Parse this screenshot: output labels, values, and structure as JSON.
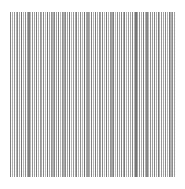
{
  "figure": {
    "background_color": "#ffffff",
    "width": 185,
    "height": 189
  },
  "plot": {
    "background_color": "#ffffff",
    "left": 10,
    "top": 12,
    "width": 166,
    "height": 165,
    "grid": false,
    "spines_visible": false,
    "axis_labels_visible": false,
    "tick_labels_visible": false,
    "title_visible": false,
    "legend_visible": false
  },
  "chart_data": {
    "type": "bar",
    "title": "",
    "subtitle": "",
    "xlabel": "",
    "ylabel": "",
    "grid": false,
    "legend": null,
    "legend_position": "none",
    "xlim": [
      0,
      90
    ],
    "ylim": [
      0,
      1
    ],
    "orientation": "vertical",
    "bar_width_px": 1.1,
    "categories": [
      "0",
      "1",
      "2",
      "3",
      "4",
      "5",
      "6",
      "7",
      "8",
      "9",
      "10",
      "11",
      "12",
      "13",
      "14",
      "15",
      "16",
      "17",
      "18",
      "19",
      "20",
      "21",
      "22",
      "23",
      "24",
      "25",
      "26",
      "27",
      "28",
      "29",
      "30",
      "31",
      "32",
      "33",
      "34",
      "35",
      "36",
      "37",
      "38",
      "39",
      "40",
      "41",
      "42",
      "43",
      "44",
      "45",
      "46",
      "47",
      "48",
      "49",
      "50",
      "51",
      "52",
      "53",
      "54",
      "55",
      "56",
      "57",
      "58",
      "59",
      "60",
      "61",
      "62",
      "63",
      "64",
      "65",
      "66",
      "67",
      "68",
      "69",
      "70",
      "71",
      "72",
      "73",
      "74",
      "75",
      "76",
      "77",
      "78",
      "79",
      "80",
      "81",
      "82",
      "83",
      "84",
      "85",
      "86",
      "87",
      "88",
      "89"
    ],
    "values": [
      1,
      1,
      1,
      1,
      1,
      1,
      1,
      1,
      1,
      1,
      1,
      1,
      1,
      1,
      1,
      1,
      1,
      1,
      1,
      1,
      1,
      1,
      1,
      1,
      1,
      1,
      1,
      1,
      1,
      1,
      1,
      1,
      1,
      1,
      1,
      1,
      1,
      1,
      1,
      1,
      1,
      1,
      1,
      1,
      1,
      1,
      1,
      1,
      1,
      1,
      1,
      1,
      1,
      1,
      1,
      1,
      1,
      1,
      1,
      1,
      1,
      1,
      1,
      1,
      1,
      1,
      1,
      1,
      1,
      1,
      1,
      1,
      1,
      1,
      1,
      1,
      1,
      1,
      1,
      1,
      1,
      1,
      1,
      1,
      1,
      1,
      1,
      1,
      1,
      1
    ],
    "series": [
      {
        "name": "intensity",
        "description": "Per-line gray intensity (0 = lightest, 1 = darkest).",
        "values": [
          0.82,
          0.3,
          0.58,
          0.22,
          0.74,
          0.4,
          0.9,
          0.26,
          0.66,
          0.36,
          0.78,
          0.18,
          0.62,
          0.44,
          0.86,
          0.24,
          0.54,
          0.34,
          0.7,
          0.2,
          0.92,
          0.38,
          0.6,
          0.28,
          0.76,
          0.46,
          0.84,
          0.16,
          0.64,
          0.32,
          0.72,
          0.42,
          0.88,
          0.22,
          0.56,
          0.36,
          0.8,
          0.26,
          0.68,
          0.18,
          0.94,
          0.4,
          0.52,
          0.3,
          0.78,
          0.24,
          0.86,
          0.34,
          0.62,
          0.44,
          0.74,
          0.2,
          0.9,
          0.28,
          0.58,
          0.38,
          0.82,
          0.16,
          0.66,
          0.42,
          0.76,
          0.32,
          0.88,
          0.24,
          0.54,
          0.36,
          0.7,
          0.22,
          0.92,
          0.4,
          0.6,
          0.3,
          0.84,
          0.26,
          0.72,
          0.18,
          0.64,
          0.46,
          0.78,
          0.34,
          0.86,
          0.2,
          0.56,
          0.38,
          0.74,
          0.28,
          0.9,
          0.24,
          0.68,
          0.44
        ]
      }
    ],
    "color_min": "#c9c9c9",
    "color_max": "#6e6e6e"
  }
}
